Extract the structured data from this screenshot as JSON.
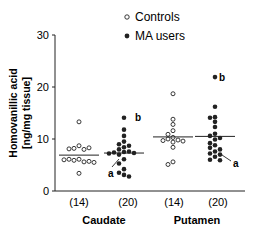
{
  "chart_data": {
    "type": "scatter",
    "title": "",
    "ylabel": "Homovanillic acid [ng/mg tissue]",
    "ylabel_line1": "Homovanillic acid",
    "ylabel_line2": "[ng/mg tissue]",
    "ylim": [
      0,
      30
    ],
    "yticks": [
      "0",
      "10",
      "20",
      "30"
    ],
    "legend": [
      {
        "name": "Controls",
        "marker": "open-circle"
      },
      {
        "name": "MA users",
        "marker": "filled-circle"
      }
    ],
    "regions": [
      "Caudate",
      "Putamen"
    ],
    "groups": [
      {
        "region": "Caudate",
        "series": "Controls",
        "n_label": "(14)",
        "median": 6.9,
        "values": [
          13.3,
          8.7,
          8.2,
          8.0,
          8.1,
          8.3,
          6.1,
          5.9,
          5.6,
          6.1,
          5.7,
          6.0,
          5.5,
          3.4
        ]
      },
      {
        "region": "Caudate",
        "series": "MA users",
        "n_label": "(20)",
        "median": 7.3,
        "annotations": [
          "a",
          "b"
        ],
        "values": [
          14.1,
          11.8,
          10.6,
          9.5,
          9.0,
          8.7,
          8.4,
          8.0,
          7.6,
          7.5,
          7.4,
          7.3,
          7.2,
          7.0,
          6.1,
          5.3,
          4.2,
          3.5,
          3.1,
          2.8
        ]
      },
      {
        "region": "Putamen",
        "series": "Controls",
        "n_label": "(14)",
        "median": 10.4,
        "values": [
          18.7,
          13.8,
          12.8,
          11.6,
          10.9,
          10.3,
          10.0,
          9.8,
          9.7,
          9.6,
          9.4,
          8.4,
          5.6,
          5.1
        ]
      },
      {
        "region": "Putamen",
        "series": "MA users",
        "n_label": "(20)",
        "median": 10.5,
        "annotations": [
          "a",
          "b"
        ],
        "values": [
          21.9,
          16.2,
          14.2,
          14.1,
          13.3,
          12.3,
          11.0,
          10.6,
          10.2,
          9.9,
          9.2,
          8.8,
          8.3,
          8.0,
          7.6,
          7.2,
          7.0,
          6.6,
          6.0,
          5.9
        ]
      }
    ]
  },
  "labels": {
    "legend_controls": "Controls",
    "legend_ma": "MA users",
    "caudate": "Caudate",
    "putamen": "Putamen",
    "n_caudate_ctrl": "(14)",
    "n_caudate_ma": "(20)",
    "n_putamen_ctrl": "(14)",
    "n_putamen_ma": "(20)",
    "ann_a": "a",
    "ann_b": "b"
  }
}
